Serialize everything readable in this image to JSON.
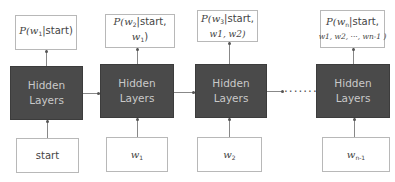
{
  "diagram": {
    "columns": [
      {
        "output": {
          "prefix": "P(",
          "var": "w",
          "sub": "1",
          "rest": "|start)"
        },
        "hidden_label_1": "Hidden",
        "hidden_label_2": "Layers",
        "input": {
          "text": "start"
        }
      },
      {
        "output": {
          "prefix": "P(",
          "var": "w",
          "sub": "2",
          "rest": "|start,",
          "line2_var": "w",
          "line2_sub": "1",
          "line2_rest": ")"
        },
        "hidden_label_1": "Hidden",
        "hidden_label_2": "Layers",
        "input": {
          "var": "w",
          "sub": "1"
        }
      },
      {
        "output": {
          "prefix": "P(",
          "var": "w",
          "sub": "3",
          "rest": "|start,",
          "line2": "w1, w2)"
        },
        "hidden_label_1": "Hidden",
        "hidden_label_2": "Layers",
        "input": {
          "var": "w",
          "sub": "2"
        }
      },
      {
        "output": {
          "prefix": "P(",
          "var": "w",
          "sub": "n",
          "rest": "|start,",
          "line2": "w1, w2, ···, wn-1 )"
        },
        "hidden_label_1": "Hidden",
        "hidden_label_2": "Layers",
        "input": {
          "var": "w",
          "sub": "n-1"
        }
      }
    ],
    "ellipsis": "·······",
    "colors": {
      "hidden_fill": "#4a4a4a",
      "hidden_text": "#c9c9c9",
      "box_border": "#b8b8b8",
      "connector": "#888888"
    }
  }
}
